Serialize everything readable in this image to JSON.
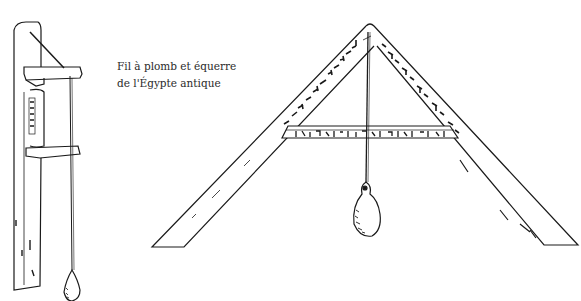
{
  "caption": {
    "line1": "Fil à plomb et équerre",
    "line2": "de l'Égypte antique"
  },
  "illustrations": [
    {
      "name": "plumb-line-tool",
      "description": "Egyptian plumb line with wooden frame and bob"
    },
    {
      "name": "a-frame-level",
      "description": "Egyptian A-frame square with hieroglyph inscriptions and plumb bob"
    }
  ],
  "colors": {
    "ink": "#1a1a1a",
    "paper": "#ffffff"
  }
}
